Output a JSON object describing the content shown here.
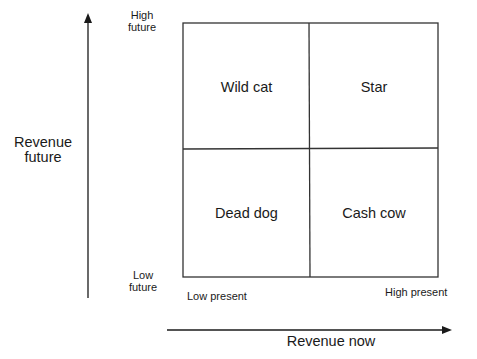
{
  "diagram": {
    "type": "2x2 matrix",
    "y_axis": {
      "label": "Revenue future",
      "label_lines": [
        "Revenue",
        "future"
      ],
      "high": "High future",
      "high_lines": [
        "High",
        "future"
      ],
      "low": "Low future",
      "low_lines": [
        "Low",
        "future"
      ]
    },
    "x_axis": {
      "label": "Revenue now",
      "low": "Low present",
      "high": "High present"
    },
    "quadrants": {
      "top_left": "Wild cat",
      "top_right": "Star",
      "bottom_left": "Dead dog",
      "bottom_right": "Cash cow"
    },
    "line_color": "#1a1a1a"
  }
}
